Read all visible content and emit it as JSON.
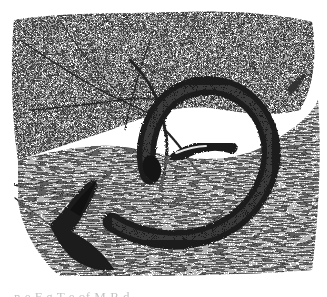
{
  "illustration": {
    "subject": "coiled snake on rock beneath tree foliage",
    "style": "black-and-white stipple engraving",
    "colors": {
      "background": "#ffffff",
      "ink_dark": "#1a1a1a",
      "ink_mid": "#5a5a5a",
      "ink_light": "#a8a8a8"
    },
    "elements": [
      {
        "name": "foliage-canopy",
        "region": "top"
      },
      {
        "name": "branches",
        "region": "left-center"
      },
      {
        "name": "snake-coil",
        "region": "center-right"
      },
      {
        "name": "snake-head",
        "region": "center"
      },
      {
        "name": "rock-surface",
        "region": "bottom-right"
      },
      {
        "name": "ground-shadow",
        "region": "bottom-left"
      },
      {
        "name": "small-bird",
        "region": "right"
      }
    ]
  },
  "caption": {
    "text": "n     e  F  g  T  e            of  M     R  d",
    "truncated": true
  }
}
